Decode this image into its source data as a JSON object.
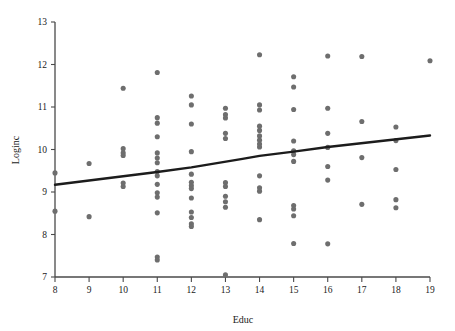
{
  "chart_data": {
    "type": "scatter",
    "title": "",
    "xlabel": "Educ",
    "ylabel": "Loginc",
    "xlim": [
      8,
      19
    ],
    "ylim": [
      7,
      13
    ],
    "xticks": [
      8,
      9,
      10,
      11,
      12,
      13,
      14,
      15,
      16,
      17,
      18,
      19
    ],
    "yticks": [
      7,
      8,
      9,
      10,
      11,
      12,
      13
    ],
    "grid": false,
    "legend": null,
    "marker": {
      "shape": "circle",
      "color": "#6e6e6e",
      "size": 3
    },
    "points": [
      {
        "x": 8,
        "y": 9.45
      },
      {
        "x": 8,
        "y": 8.55
      },
      {
        "x": 9,
        "y": 9.67
      },
      {
        "x": 9,
        "y": 8.42
      },
      {
        "x": 10,
        "y": 11.44
      },
      {
        "x": 10,
        "y": 10.02
      },
      {
        "x": 10,
        "y": 9.92
      },
      {
        "x": 10,
        "y": 9.86
      },
      {
        "x": 10,
        "y": 9.21
      },
      {
        "x": 10,
        "y": 9.13
      },
      {
        "x": 11,
        "y": 11.81
      },
      {
        "x": 11,
        "y": 10.75
      },
      {
        "x": 11,
        "y": 10.62
      },
      {
        "x": 11,
        "y": 10.3
      },
      {
        "x": 11,
        "y": 9.92
      },
      {
        "x": 11,
        "y": 9.8
      },
      {
        "x": 11,
        "y": 9.69
      },
      {
        "x": 11,
        "y": 9.48
      },
      {
        "x": 11,
        "y": 9.38
      },
      {
        "x": 11,
        "y": 9.18
      },
      {
        "x": 11,
        "y": 8.98
      },
      {
        "x": 11,
        "y": 8.88
      },
      {
        "x": 11,
        "y": 8.51
      },
      {
        "x": 11,
        "y": 7.47
      },
      {
        "x": 11,
        "y": 7.4
      },
      {
        "x": 12,
        "y": 11.26
      },
      {
        "x": 12,
        "y": 11.05
      },
      {
        "x": 12,
        "y": 10.6
      },
      {
        "x": 12,
        "y": 9.95
      },
      {
        "x": 12,
        "y": 9.42
      },
      {
        "x": 12,
        "y": 9.23
      },
      {
        "x": 12,
        "y": 9.15
      },
      {
        "x": 12,
        "y": 9.08
      },
      {
        "x": 12,
        "y": 8.86
      },
      {
        "x": 12,
        "y": 8.53
      },
      {
        "x": 12,
        "y": 8.4
      },
      {
        "x": 12,
        "y": 8.25
      },
      {
        "x": 12,
        "y": 8.19
      },
      {
        "x": 13,
        "y": 10.97
      },
      {
        "x": 13,
        "y": 10.82
      },
      {
        "x": 13,
        "y": 10.74
      },
      {
        "x": 13,
        "y": 10.38
      },
      {
        "x": 13,
        "y": 10.26
      },
      {
        "x": 13,
        "y": 9.22
      },
      {
        "x": 13,
        "y": 9.13
      },
      {
        "x": 13,
        "y": 8.9
      },
      {
        "x": 13,
        "y": 8.77
      },
      {
        "x": 13,
        "y": 8.64
      },
      {
        "x": 13,
        "y": 7.05
      },
      {
        "x": 14,
        "y": 12.23
      },
      {
        "x": 14,
        "y": 11.05
      },
      {
        "x": 14,
        "y": 10.93
      },
      {
        "x": 14,
        "y": 10.55
      },
      {
        "x": 14,
        "y": 10.45
      },
      {
        "x": 14,
        "y": 10.32
      },
      {
        "x": 14,
        "y": 10.22
      },
      {
        "x": 14,
        "y": 10.13
      },
      {
        "x": 14,
        "y": 10.06
      },
      {
        "x": 14,
        "y": 9.38
      },
      {
        "x": 14,
        "y": 9.1
      },
      {
        "x": 14,
        "y": 9.02
      },
      {
        "x": 14,
        "y": 8.35
      },
      {
        "x": 15,
        "y": 11.71
      },
      {
        "x": 15,
        "y": 11.47
      },
      {
        "x": 15,
        "y": 10.94
      },
      {
        "x": 15,
        "y": 10.2
      },
      {
        "x": 15,
        "y": 9.97
      },
      {
        "x": 15,
        "y": 9.88
      },
      {
        "x": 15,
        "y": 9.72
      },
      {
        "x": 15,
        "y": 8.68
      },
      {
        "x": 15,
        "y": 8.6
      },
      {
        "x": 15,
        "y": 8.44
      },
      {
        "x": 15,
        "y": 7.79
      },
      {
        "x": 16,
        "y": 12.2
      },
      {
        "x": 16,
        "y": 10.97
      },
      {
        "x": 16,
        "y": 10.38
      },
      {
        "x": 16,
        "y": 10.05
      },
      {
        "x": 16,
        "y": 9.6
      },
      {
        "x": 16,
        "y": 9.28
      },
      {
        "x": 16,
        "y": 7.78
      },
      {
        "x": 17,
        "y": 12.19
      },
      {
        "x": 17,
        "y": 10.66
      },
      {
        "x": 17,
        "y": 9.81
      },
      {
        "x": 17,
        "y": 8.71
      },
      {
        "x": 18,
        "y": 10.53
      },
      {
        "x": 18,
        "y": 10.21
      },
      {
        "x": 18,
        "y": 9.53
      },
      {
        "x": 18,
        "y": 8.82
      },
      {
        "x": 18,
        "y": 8.63
      },
      {
        "x": 19,
        "y": 12.09
      }
    ],
    "fit_line": {
      "label": "linear fit",
      "color": "#1c1c1c",
      "points": [
        {
          "x": 8,
          "y": 9.17
        },
        {
          "x": 11,
          "y": 9.47
        },
        {
          "x": 12,
          "y": 9.58
        },
        {
          "x": 13.5,
          "y": 9.78
        },
        {
          "x": 14,
          "y": 9.85
        },
        {
          "x": 15,
          "y": 9.95
        },
        {
          "x": 16,
          "y": 10.06
        },
        {
          "x": 19,
          "y": 10.33
        }
      ]
    }
  }
}
